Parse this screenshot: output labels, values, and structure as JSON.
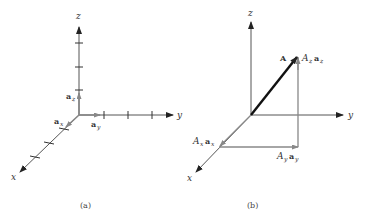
{
  "panel_a": {
    "caption": "(a)",
    "axes": {
      "x": "x",
      "y": "y",
      "z": "z"
    },
    "unit_vectors": [
      {
        "base": "a",
        "sub": "x"
      },
      {
        "base": "a",
        "sub": "y"
      },
      {
        "base": "a",
        "sub": "z"
      }
    ]
  },
  "panel_b": {
    "caption": "(b)",
    "axes": {
      "x": "x",
      "y": "y",
      "z": "z"
    },
    "vector": "A",
    "components": [
      {
        "coef": "A",
        "coef_sub": "x",
        "base": "a",
        "sub": "x"
      },
      {
        "coef": "A",
        "coef_sub": "y",
        "base": "a",
        "sub": "y"
      },
      {
        "coef": "A",
        "coef_sub": "z",
        "base": "a",
        "sub": "z"
      }
    ]
  }
}
